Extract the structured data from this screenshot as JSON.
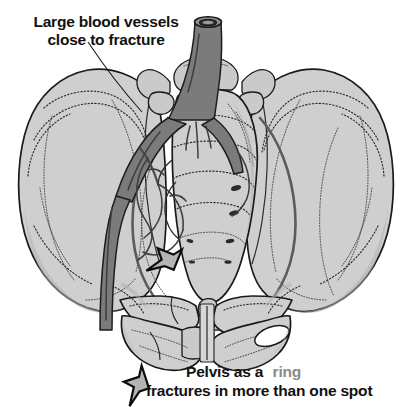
{
  "figure": {
    "background_color": "#ffffff",
    "bone_color": "#cfcfcf",
    "vessel_color": "#7b7b7b",
    "outline_color": "#1a1a1a",
    "arrow_fill_color": "#b4b4b4"
  },
  "annotations": {
    "top_label": {
      "line1": "Large blood vessels",
      "line2": "close to fracture",
      "color": "#111111",
      "leader_icon": "leader-line-icon"
    },
    "bottom_label": {
      "line1_part1": "Pelvis as a",
      "line1_highlight": "ring",
      "line1_highlight_color": "#8a8a8a",
      "line2": "fractures in more than one spot",
      "color": "#111111"
    },
    "arrows": [
      {
        "name": "sacral-fracture-arrow",
        "direction": "up-right",
        "points_at": "sacral ala fracture"
      },
      {
        "name": "pubic-ramus-fracture-arrow",
        "direction": "up-left",
        "points_at": "inferior pubic ramus fracture"
      }
    ]
  },
  "anatomy": {
    "structures": [
      "left iliac wing",
      "right iliac wing",
      "sacrum",
      "coccyx",
      "pubic symphysis",
      "superior pubic ramus",
      "inferior pubic ramus",
      "ischium",
      "acetabulum",
      "obturator foramen",
      "sacroiliac joint",
      "lumbar vertebra"
    ],
    "vessels": [
      "abdominal aorta",
      "common iliac artery",
      "internal iliac artery",
      "external iliac artery",
      "femoral artery"
    ]
  }
}
